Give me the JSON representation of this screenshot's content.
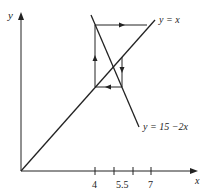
{
  "diagram": {
    "type": "cobweb",
    "axis_labels": {
      "x": "x",
      "y": "y"
    },
    "x_ticks": [
      {
        "value": 4,
        "label": "4"
      },
      {
        "value": 5,
        "label": ""
      },
      {
        "value": 6,
        "label": ""
      },
      {
        "value": 7,
        "label": "7"
      }
    ],
    "extra_tick_label": "5.5",
    "lines": [
      {
        "name": "identity",
        "label": "y = x"
      },
      {
        "name": "decreasing",
        "label": "y = 15 −2x"
      }
    ],
    "cobweb": {
      "start_x": 4,
      "path": "vertical up at x=4 to y=7, horizontal right, down at x≈5.5, left to x=4",
      "arrows": [
        "up",
        "right",
        "down",
        "left"
      ]
    },
    "colors": {
      "stroke": "#222222",
      "background": "#ffffff"
    }
  }
}
